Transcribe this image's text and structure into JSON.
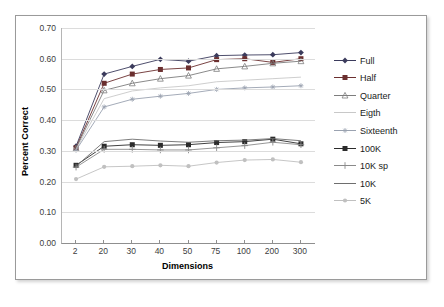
{
  "chart_data": {
    "type": "line",
    "title": "",
    "xlabel": "Dimensions",
    "ylabel": "Percent Correct",
    "categories": [
      "2",
      "20",
      "30",
      "40",
      "50",
      "75",
      "100",
      "200",
      "300"
    ],
    "ylim": [
      0.0,
      0.7
    ],
    "ytick_labels": [
      "0.70",
      "0.60",
      "0.50",
      "0.40",
      "0.30",
      "0.20",
      "0.10",
      "0.00"
    ],
    "ytick_values": [
      0.7,
      0.6,
      0.5,
      0.4,
      0.3,
      0.2,
      0.1,
      0.0
    ],
    "grid": "horizontal",
    "legend_position": "right",
    "series": [
      {
        "name": "Full",
        "color": "#3b3b5c",
        "marker": "diamond",
        "values": [
          0.315,
          0.55,
          0.575,
          0.598,
          0.592,
          0.61,
          0.612,
          0.613,
          0.62
        ]
      },
      {
        "name": "Half",
        "color": "#6b2f2f",
        "marker": "square",
        "values": [
          0.31,
          0.52,
          0.55,
          0.565,
          0.57,
          0.597,
          0.6,
          0.588,
          0.6
        ]
      },
      {
        "name": "Quarter",
        "color": "#7d7d7d",
        "marker": "triangle",
        "values": [
          0.308,
          0.497,
          0.52,
          0.535,
          0.545,
          0.567,
          0.575,
          0.585,
          0.592
        ]
      },
      {
        "name": "Eigth",
        "color": "#c8c8c8",
        "marker": "none",
        "values": [
          0.305,
          0.47,
          0.495,
          0.505,
          0.512,
          0.525,
          0.53,
          0.535,
          0.54
        ]
      },
      {
        "name": "Sixteenth",
        "color": "#9aa2b0",
        "marker": "star",
        "values": [
          0.302,
          0.443,
          0.468,
          0.478,
          0.487,
          0.5,
          0.505,
          0.508,
          0.512
        ]
      },
      {
        "name": "100K",
        "color": "#2b2b2b",
        "marker": "square",
        "values": [
          0.253,
          0.315,
          0.32,
          0.318,
          0.32,
          0.327,
          0.33,
          0.338,
          0.323
        ]
      },
      {
        "name": "10K sp",
        "color": "#8a8a8a",
        "marker": "plus",
        "values": [
          0.247,
          0.305,
          0.305,
          0.303,
          0.303,
          0.31,
          0.317,
          0.328,
          0.32
        ]
      },
      {
        "name": "10K",
        "color": "#6e6e6e",
        "marker": "none",
        "values": [
          0.25,
          0.33,
          0.338,
          0.332,
          0.328,
          0.333,
          0.335,
          0.34,
          0.333
        ]
      },
      {
        "name": "5K",
        "color": "#c0c0c0",
        "marker": "circle",
        "values": [
          0.208,
          0.248,
          0.25,
          0.253,
          0.25,
          0.262,
          0.27,
          0.272,
          0.263
        ]
      }
    ]
  },
  "legend": {
    "items": [
      {
        "label": "Full"
      },
      {
        "label": "Half"
      },
      {
        "label": "Quarter"
      },
      {
        "label": "Eigth"
      },
      {
        "label": "Sixteenth"
      },
      {
        "label": "100K"
      },
      {
        "label": "10K sp"
      },
      {
        "label": "10K"
      },
      {
        "label": "5K"
      }
    ]
  }
}
